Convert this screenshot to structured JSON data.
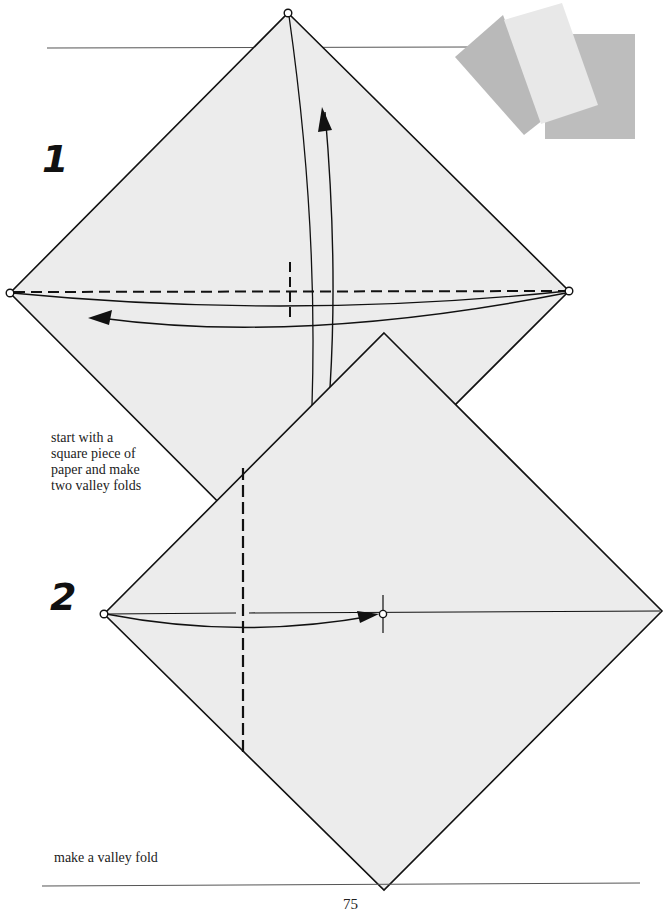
{
  "page": {
    "page_number": "75",
    "paper_color": "#ececec",
    "line_color": "#111111"
  },
  "swatches": [
    {
      "name": "swatch-gray-left",
      "color": "#b9b9b9"
    },
    {
      "name": "swatch-light-middle",
      "color": "#e8e8e8"
    },
    {
      "name": "swatch-gray-right",
      "color": "#bdbdbd"
    }
  ],
  "steps": [
    {
      "number": "1",
      "caption_lines": [
        "start with a",
        "square piece of",
        "paper and make",
        "two valley folds"
      ]
    },
    {
      "number": "2",
      "caption_lines": [
        "make a valley fold"
      ]
    }
  ]
}
